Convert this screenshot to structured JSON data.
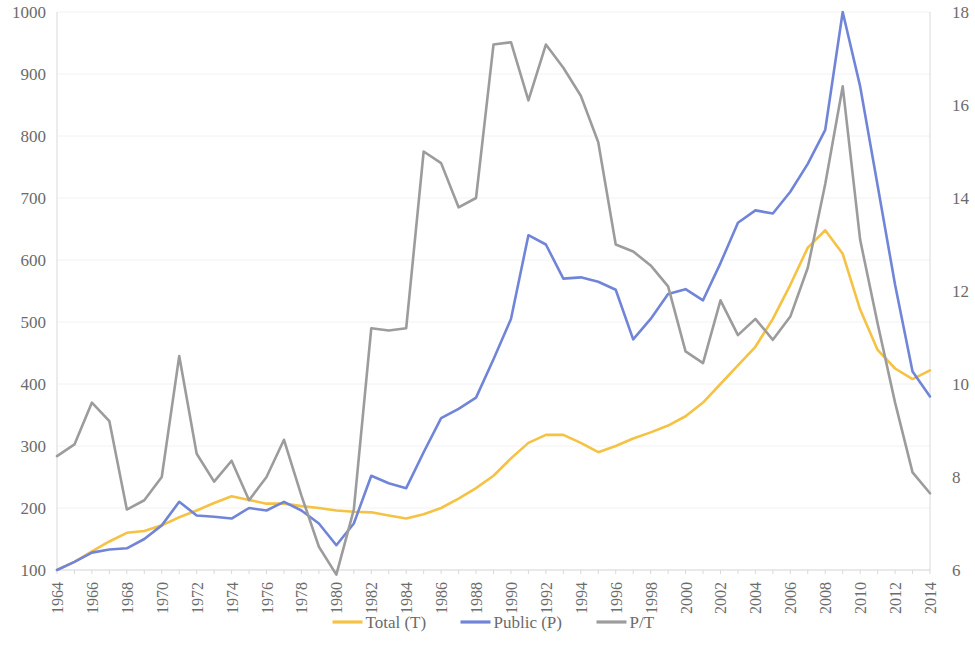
{
  "chart_data": {
    "type": "line",
    "title": "",
    "subtitle": "",
    "xlabel": "",
    "ylabel": "",
    "grid": true,
    "legend_position": "bottom",
    "x": [
      1964,
      1965,
      1966,
      1967,
      1968,
      1969,
      1970,
      1971,
      1972,
      1973,
      1974,
      1975,
      1976,
      1977,
      1978,
      1979,
      1980,
      1981,
      1982,
      1983,
      1984,
      1985,
      1986,
      1987,
      1988,
      1989,
      1990,
      1991,
      1992,
      1993,
      1994,
      1995,
      1996,
      1997,
      1998,
      1999,
      2000,
      2001,
      2002,
      2003,
      2004,
      2005,
      2006,
      2007,
      2008,
      2009,
      2010,
      2011,
      2012,
      2013,
      2014
    ],
    "x_tick_labels": [
      "1964",
      "1966",
      "1968",
      "1970",
      "1972",
      "1974",
      "1976",
      "1978",
      "1980",
      "1982",
      "1984",
      "1986",
      "1988",
      "1990",
      "1992",
      "1994",
      "1996",
      "1998",
      "2000",
      "2002",
      "2004",
      "2006",
      "2008",
      "2010",
      "2012",
      "2014"
    ],
    "left_axis": {
      "label": "",
      "ylim": [
        100,
        1000
      ],
      "ticks": [
        100,
        200,
        300,
        400,
        500,
        600,
        700,
        800,
        900,
        1000
      ],
      "tick_labels": [
        "100",
        "200",
        "300",
        "400",
        "500",
        "600",
        "700",
        "800",
        "900",
        "1000"
      ]
    },
    "right_axis": {
      "label": "",
      "ylim": [
        6,
        18
      ],
      "ticks": [
        6,
        8,
        10,
        12,
        14,
        16,
        18
      ],
      "tick_labels": [
        "6",
        "8",
        "10",
        "12",
        "14",
        "16",
        "18"
      ]
    },
    "series": [
      {
        "name": "Total (T)",
        "key": "total",
        "axis": "left",
        "color": "#F5C243",
        "values": [
          100,
          113,
          130,
          146,
          160,
          163,
          172,
          185,
          196,
          208,
          219,
          213,
          207,
          207,
          203,
          200,
          196,
          194,
          193,
          188,
          183,
          190,
          200,
          215,
          232,
          252,
          280,
          305,
          318,
          318,
          305,
          290,
          300,
          312,
          322,
          333,
          348,
          370,
          400,
          430,
          460,
          505,
          560,
          620,
          648,
          610,
          520,
          455,
          425,
          408,
          422
        ]
      },
      {
        "name": "Public (P)",
        "key": "public",
        "axis": "left",
        "color": "#7185D8",
        "values": [
          100,
          113,
          128,
          133,
          135,
          150,
          172,
          210,
          188,
          186,
          183,
          200,
          196,
          210,
          196,
          175,
          140,
          175,
          252,
          240,
          232,
          290,
          345,
          360,
          378,
          440,
          505,
          640,
          625,
          570,
          572,
          565,
          552,
          472,
          505,
          545,
          553,
          535,
          595,
          660,
          680,
          675,
          710,
          755,
          810,
          1000,
          880,
          720,
          560,
          420,
          380
        ]
      },
      {
        "name": "P/T",
        "key": "pt",
        "axis": "right",
        "color": "#9C9C9C",
        "values": [
          8.45,
          8.7,
          9.6,
          9.2,
          7.3,
          7.5,
          8.0,
          10.6,
          8.5,
          7.9,
          8.35,
          7.5,
          8.0,
          8.8,
          7.6,
          6.5,
          5.9,
          7.3,
          11.2,
          11.15,
          11.2,
          15.0,
          14.75,
          13.8,
          14.0,
          17.3,
          17.35,
          16.1,
          17.3,
          16.8,
          16.2,
          15.2,
          13.0,
          12.85,
          12.55,
          12.1,
          10.7,
          10.45,
          11.8,
          11.05,
          11.4,
          10.95,
          11.45,
          12.5,
          14.3,
          16.4,
          13.1,
          11.3,
          9.6,
          8.1,
          7.65
        ]
      }
    ]
  },
  "legend": {
    "items": [
      {
        "label": "Total (T)",
        "color": "#F5C243"
      },
      {
        "label": "Public (P)",
        "color": "#7185D8"
      },
      {
        "label": "P/T",
        "color": "#9C9C9C"
      }
    ]
  }
}
